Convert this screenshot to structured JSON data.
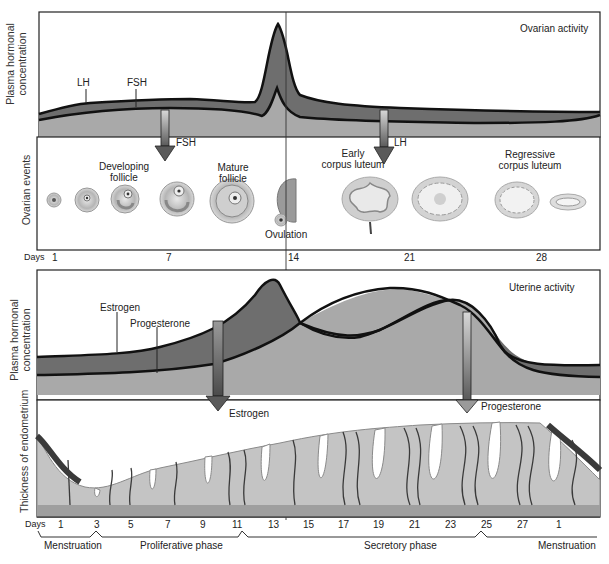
{
  "top_panel": {
    "title": "Ovarian activity",
    "y_axis_label_line1": "Plasma hormonal",
    "y_axis_label_line2": "concentration",
    "hormones": [
      "LH",
      "FSH"
    ],
    "arrows": [
      {
        "label": "FSH"
      },
      {
        "label": "LH"
      }
    ]
  },
  "ovarian_events": {
    "y_axis_label": "Ovarian events",
    "labels": {
      "developing_1": "Developing",
      "developing_2": "follicle",
      "mature_1": "Mature",
      "mature_2": "follicle",
      "ovulation": "Ovulation",
      "early_cl_1": "Early",
      "early_cl_2": "corpus luteum",
      "regressive_1": "Regressive",
      "regressive_2": "corpus luteum"
    }
  },
  "days_axis_top": {
    "label": "Days",
    "ticks": [
      "1",
      "7",
      "14",
      "21",
      "28"
    ]
  },
  "bottom_panel": {
    "title": "Uterine activity",
    "y_axis_label_line1": "Plasma hormonal",
    "y_axis_label_line2": "concentration",
    "hormones": [
      "Estrogen",
      "Progesterone"
    ],
    "arrows": [
      {
        "label": "Estrogen"
      },
      {
        "label": "Progesterone"
      }
    ]
  },
  "endometrium": {
    "y_axis_label": "Thickness of endometrium"
  },
  "days_axis_bottom": {
    "label": "Days",
    "ticks": [
      "1",
      "3",
      "5",
      "7",
      "9",
      "11",
      "13",
      "15",
      "17",
      "19",
      "21",
      "23",
      "25",
      "27",
      "1"
    ]
  },
  "phases": [
    "Menstruation",
    "Proliferative phase",
    "Secretory phase",
    "Menstruation"
  ],
  "colors": {
    "dark_band": "#6e6e6e",
    "light_band": "#a9a9a9",
    "outline": "#111111",
    "arrow_light": "#c8c8c8",
    "arrow_dark": "#5a5a5a"
  }
}
